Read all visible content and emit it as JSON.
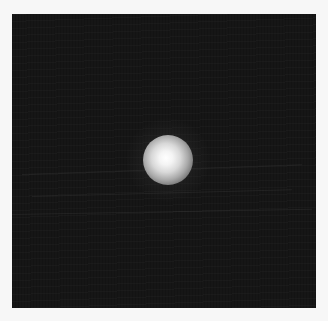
{
  "image": {
    "background_color": "#f7f7f7",
    "frame_color": "#161616",
    "blob_core_color": "#ffffff",
    "description": "bright circular spot on dark noisy background"
  }
}
